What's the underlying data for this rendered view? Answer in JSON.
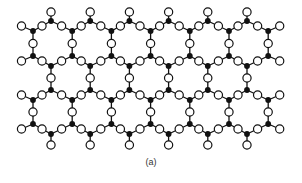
{
  "figure": {
    "caption": "(a)"
  },
  "style": {
    "line_color": "#111111",
    "black_node_color": "#111111",
    "white_node_fill": "#ffffff",
    "white_node_stroke": "#111111"
  },
  "lattice": {
    "columns": 6,
    "dx": 39.2,
    "rows": [
      {
        "name": "A",
        "x0": 51,
        "y": 21,
        "count": 6
      },
      {
        "name": "B",
        "x0": 33,
        "y": 31,
        "count": 7
      },
      {
        "name": "C",
        "x0": 33,
        "y": 56,
        "count": 7
      },
      {
        "name": "D",
        "x0": 51,
        "y": 66,
        "count": 6
      },
      {
        "name": "E",
        "x0": 51,
        "y": 90,
        "count": 6
      },
      {
        "name": "F",
        "x0": 33,
        "y": 100,
        "count": 7
      },
      {
        "name": "G",
        "x0": 33,
        "y": 124,
        "count": 7
      },
      {
        "name": "H",
        "x0": 51,
        "y": 134,
        "count": 6
      }
    ],
    "pendant_top_y": 12,
    "pendant_bottom_y": 145,
    "pendant_side_dx": 11.5,
    "pendant_side_dy": 5
  }
}
